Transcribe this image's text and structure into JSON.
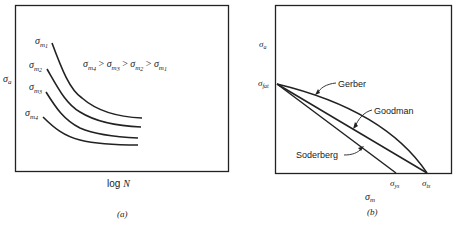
{
  "panel_a": {
    "caption": "(a)",
    "y_label": "σ",
    "y_label_sub": "a",
    "x_label": "log N",
    "relation": {
      "parts": [
        {
          "sym": "σ",
          "sub": "m",
          "subsub": "4"
        },
        {
          "op": ">"
        },
        {
          "sym": "σ",
          "sub": "m",
          "subsub": "3"
        },
        {
          "op": ">"
        },
        {
          "sym": "σ",
          "sub": "m",
          "subsub": "2"
        },
        {
          "op": ">"
        },
        {
          "sym": "σ",
          "sub": "m",
          "subsub": "1"
        }
      ],
      "text": "σm4 > σm3 > σm2 > σm1"
    },
    "curves": [
      {
        "label": "σm1",
        "sym": "σ",
        "sub": "m",
        "subsub": "1"
      },
      {
        "label": "σm2",
        "sym": "σ",
        "sub": "m",
        "subsub": "2"
      },
      {
        "label": "σm3",
        "sym": "σ",
        "sub": "m",
        "subsub": "3"
      },
      {
        "label": "σm4",
        "sym": "σ",
        "sub": "m",
        "subsub": "4"
      }
    ]
  },
  "panel_b": {
    "caption": "(b)",
    "y_label": "σ",
    "y_label_sub": "a",
    "x_label": "σ",
    "x_label_sub": "m",
    "y_intercept": {
      "sym": "σ",
      "sub": "fat"
    },
    "x_ticks": [
      {
        "sym": "σ",
        "sub": "ys"
      },
      {
        "sym": "σ",
        "sub": "ts"
      }
    ],
    "lines": [
      {
        "name": "Gerber",
        "shape": "parabola"
      },
      {
        "name": "Goodman",
        "shape": "straight"
      },
      {
        "name": "Soderberg",
        "shape": "straight"
      }
    ]
  },
  "colors": {
    "ink": "#222222",
    "background": "#ffffff"
  }
}
